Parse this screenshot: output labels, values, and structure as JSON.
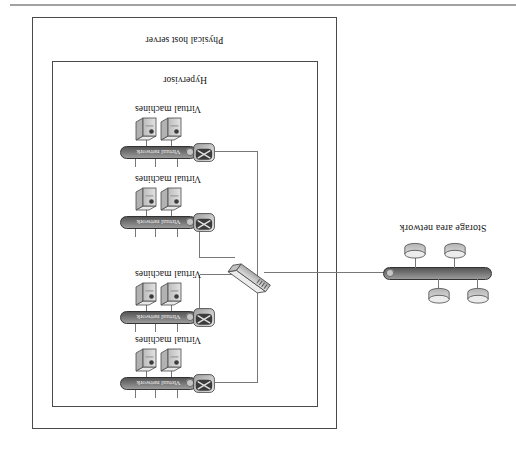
{
  "diagram": {
    "outer_box": {
      "label": "Physical host server"
    },
    "inner_box": {
      "label": "Hypervisor"
    },
    "vm_groups": [
      {
        "machines_label": "Virtual machines",
        "network_label": "Virtual network"
      },
      {
        "machines_label": "Virtual machines",
        "network_label": "Virtual network"
      },
      {
        "machines_label": "Virtual machines",
        "network_label": "Virtual network"
      },
      {
        "machines_label": "Virtual machines",
        "network_label": "Virtual network"
      }
    ],
    "san": {
      "label": "Storage area network",
      "disk_count": 4
    },
    "icons": {
      "vm": "tower-server-icon",
      "adapter": "network-adapter-icon",
      "switch": "switch-icon",
      "storage": "disk-cylinder-icon",
      "bus": "network-bus-icon"
    },
    "colors": {
      "page_rule": "#a2a2a2",
      "box_border": "#4a4a4a",
      "connector_line": "#787878",
      "bus_dark": "#555555",
      "bus_light": "#9b9b9b",
      "icon_gray": "#c9c9c9",
      "text": "#141414",
      "bus_text": "#f1f1f1"
    }
  }
}
